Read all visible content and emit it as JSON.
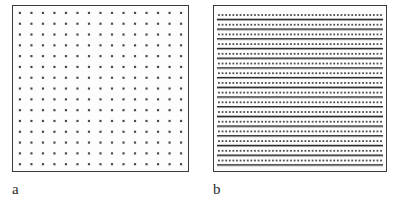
{
  "figure": {
    "background_color": "#ffffff",
    "panel_border_color": "#3a3a3a",
    "panel_fill_color": "#fdfdfd",
    "dot_color": "#4a4a4a",
    "line_color": "#2e2e2e"
  },
  "panels": [
    {
      "id": "a",
      "label": "a",
      "pattern_type": "square-dot-lattice",
      "description": "regular square array of discrete dots",
      "x": 12,
      "y": 5,
      "width": 177,
      "height": 167,
      "columns": 15,
      "rows": 15,
      "dot_size": 2.2,
      "dot_color": "#4a4a4a",
      "border_color": "#3a3a3a",
      "fill_color": "#fdfdfd"
    },
    {
      "id": "b",
      "label": "b",
      "pattern_type": "layered-striped-bands",
      "description": "dense horizontal rows of dots separated by dark horizontal lines",
      "x": 213,
      "y": 5,
      "width": 174,
      "height": 167,
      "band_count": 16,
      "dots_per_band": 46,
      "dot_size": 1.8,
      "dot_color": "#4a4a4a",
      "line_color": "#2e2e2e",
      "line_thickness": 1.4,
      "border_color": "#3a3a3a",
      "fill_color": "#fdfdfd"
    }
  ],
  "chart_data": {
    "type": "scatter",
    "title": "",
    "xlabel": "",
    "ylabel": "",
    "subfigures": [
      {
        "label": "a",
        "type": "scatter",
        "structure": "square lattice",
        "grid_columns": 15,
        "grid_rows": 15,
        "total_points": 225,
        "x_spacing_px": 11.4,
        "y_spacing_px": 10.8,
        "legend": []
      },
      {
        "label": "b",
        "type": "scatter",
        "structure": "layered bands",
        "bands": 16,
        "points_per_band": 46,
        "total_points": 736,
        "band_spacing_px": 10.3,
        "legend": []
      }
    ]
  }
}
